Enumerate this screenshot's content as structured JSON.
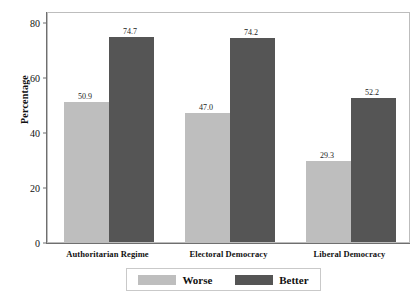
{
  "chart_data": {
    "type": "bar",
    "title": "",
    "xlabel": "",
    "ylabel": "Percentage",
    "ylim": [
      0,
      84
    ],
    "yticks": [
      0,
      20,
      40,
      60,
      80
    ],
    "grid": true,
    "legend_position": "bottom",
    "categories": [
      "Authoritarian Regime",
      "Electoral Democracy",
      "Liberal Democracy"
    ],
    "series": [
      {
        "name": "Worse",
        "color": "#bebebe",
        "values": [
          50.9,
          47.0,
          29.3
        ],
        "labels": [
          "50.9",
          "47.0",
          "29.3"
        ]
      },
      {
        "name": "Better",
        "color": "#555555",
        "values": [
          74.7,
          74.2,
          52.2
        ],
        "labels": [
          "74.7",
          "74.2",
          "52.2"
        ]
      }
    ]
  },
  "axis": {
    "y_title": "Percentage",
    "y_tick_labels": [
      "80",
      "60",
      "40",
      "20",
      "0"
    ],
    "x_tick_labels": [
      "Authoritarian Regime",
      "Electoral Democracy",
      "Liberal Democracy"
    ]
  },
  "legend": {
    "items": [
      {
        "label": "Worse",
        "color": "#bebebe"
      },
      {
        "label": "Better",
        "color": "#555555"
      }
    ]
  },
  "values": {
    "g0s0": "50.9",
    "g0s1": "74.7",
    "g1s0": "47.0",
    "g1s1": "74.2",
    "g2s0": "29.3",
    "g2s1": "52.2"
  }
}
